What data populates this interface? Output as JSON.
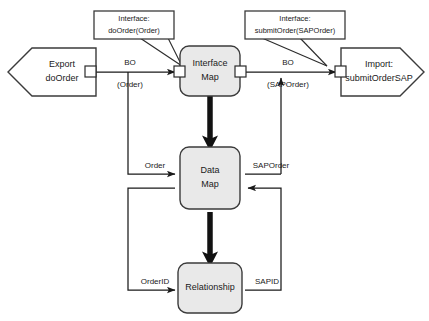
{
  "diagram": {
    "background_color": "#ffffff",
    "node_fill_color": "#e9e9e9",
    "node_stroke_color": "#3b3b3b",
    "connector_color": "#1a1a1a",
    "nodes": [
      {
        "id": "export",
        "label_line1": "Export",
        "label_line2": "doOrder",
        "shape": "pentagon-left",
        "fill": "#ffffff"
      },
      {
        "id": "interface_map",
        "label_line1": "Interface",
        "label_line2": "Map",
        "shape": "rounded-rect",
        "fill": "#e9e9e9"
      },
      {
        "id": "import",
        "label_line1": "Import:",
        "label_line2": "submitOrderSAP",
        "shape": "pentagon-right",
        "fill": "#ffffff"
      },
      {
        "id": "data_map",
        "label_line1": "Data",
        "label_line2": "Map",
        "shape": "rounded-rect",
        "fill": "#e9e9e9"
      },
      {
        "id": "relationship",
        "label_line1": "Relationship",
        "label_line2": "",
        "shape": "rounded-rect",
        "fill": "#e9e9e9"
      }
    ],
    "callouts": [
      {
        "id": "callout_left",
        "line1": "Interface:",
        "line2": "doOrder(Order)"
      },
      {
        "id": "callout_right",
        "line1": "Interface:",
        "line2": "submitOrder(SAPOrder)"
      }
    ],
    "edge_labels": [
      {
        "id": "bo_left",
        "line1": "BO",
        "line2": "(Order)"
      },
      {
        "id": "bo_right",
        "line1": "BO",
        "line2": "(SAPOrder)"
      },
      {
        "id": "order",
        "line1": "Order",
        "line2": ""
      },
      {
        "id": "saporder",
        "line1": "SAPOrder",
        "line2": ""
      },
      {
        "id": "orderid",
        "line1": "OrderID",
        "line2": ""
      },
      {
        "id": "sapid",
        "line1": "SAPID",
        "line2": ""
      }
    ]
  }
}
